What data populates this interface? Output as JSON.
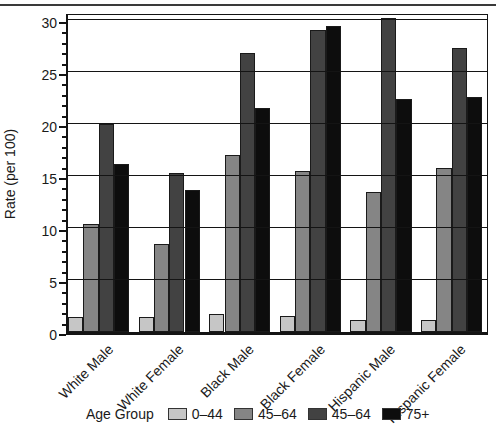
{
  "chart_data": {
    "type": "bar",
    "title": "",
    "xlabel": "",
    "ylabel": "Rate (per 100)",
    "ylim": [
      0,
      30.9
    ],
    "yticks_major": [
      0,
      5,
      10,
      15,
      20,
      25,
      30
    ],
    "minor_tick_interval": 1,
    "grid": "horizontal major gridlines every 5, drawn over bars",
    "legend_title": "Age Group",
    "legend_position": "bottom",
    "categories": [
      "White Male",
      "White Female",
      "Black Male",
      "Black Female",
      "Hispanic Male",
      "Hispanic Female"
    ],
    "series": [
      {
        "name": "0–44",
        "color": "#c6c6c6",
        "values": [
          1.4,
          1.4,
          1.7,
          1.5,
          1.2,
          1.2
        ]
      },
      {
        "name": "45–64",
        "color": "#858585",
        "values": [
          10.4,
          8.5,
          17.0,
          15.5,
          13.5,
          15.8
        ]
      },
      {
        "name": "45–64",
        "color": "#424242",
        "values": [
          20.0,
          15.3,
          26.8,
          29.0,
          30.2,
          27.3
        ]
      },
      {
        "name": "75+",
        "color": "#0d0d0d",
        "values": [
          16.2,
          13.7,
          21.5,
          29.4,
          22.4,
          22.6
        ]
      }
    ]
  }
}
